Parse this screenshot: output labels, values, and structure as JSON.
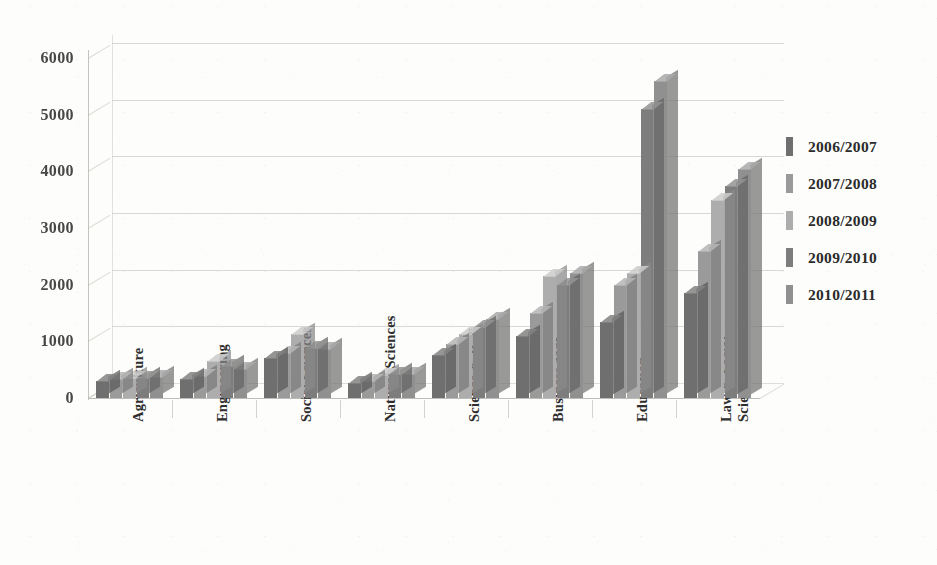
{
  "chart_data": {
    "type": "bar",
    "title": "",
    "subtitle": "",
    "xlabel": "",
    "ylabel": "",
    "ylim": [
      0,
      6000
    ],
    "ytick_labels": [
      "0",
      "1000",
      "2000",
      "3000",
      "4000",
      "5000",
      "6000"
    ],
    "ytick_values": [
      0,
      1000,
      2000,
      3000,
      4000,
      5000,
      6000
    ],
    "grid": true,
    "legend_position": "right",
    "style": "3d-clustered-column",
    "categories": [
      "Agriculture",
      "Engineering",
      "Social Sciences",
      "Natural Sciences",
      "Science & ICT",
      "Business Mgt",
      "Education",
      "Law & Social Sciences"
    ],
    "series": [
      {
        "name": "2006/2007",
        "color": "#6f6f6f",
        "values": [
          300,
          330,
          700,
          260,
          760,
          1100,
          1350,
          1850
        ]
      },
      {
        "name": "2007/2008",
        "color": "#9a9a9a",
        "values": [
          330,
          380,
          800,
          300,
          950,
          1500,
          2000,
          2600
        ]
      },
      {
        "name": "2008/2009",
        "color": "#adadad",
        "values": [
          350,
          650,
          1130,
          400,
          1130,
          2150,
          2200,
          3500
        ]
      },
      {
        "name": "2009/2010",
        "color": "#7d7d7d",
        "values": [
          360,
          560,
          880,
          420,
          1250,
          2000,
          5100,
          3750
        ]
      },
      {
        "name": "2010/2011",
        "color": "#909090",
        "values": [
          370,
          520,
          860,
          430,
          1400,
          2200,
          5600,
          4050
        ]
      }
    ]
  },
  "legend": {
    "items": [
      {
        "label": "2006/2007"
      },
      {
        "label": "2007/2008"
      },
      {
        "label": "2008/2009"
      },
      {
        "label": "2009/2010"
      },
      {
        "label": "2010/2011"
      }
    ]
  }
}
